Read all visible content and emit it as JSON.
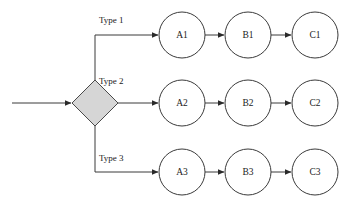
{
  "diagram": {
    "colors": {
      "background": "#ffffff",
      "stroke": "#3a3a3a",
      "decision_fill": "#d6d6d6",
      "node_fill": "#ffffff",
      "text": "#1a1a1a"
    },
    "input": {
      "label": ""
    },
    "decision": {
      "label": "",
      "shape": "diamond"
    },
    "branches": [
      {
        "label": "Type 1",
        "nodes": [
          "A1",
          "B1",
          "C1"
        ]
      },
      {
        "label": "Type 2",
        "nodes": [
          "A2",
          "B2",
          "C2"
        ]
      },
      {
        "label": "Type 3",
        "nodes": [
          "A3",
          "B3",
          "C3"
        ]
      }
    ]
  }
}
